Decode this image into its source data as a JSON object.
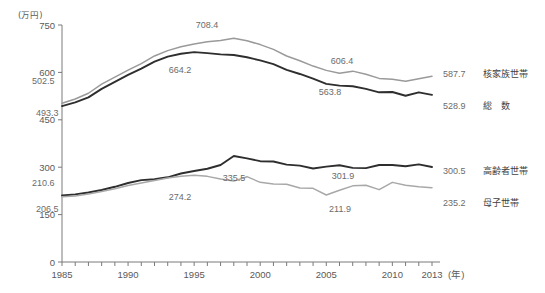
{
  "chart_data": {
    "type": "line",
    "title": "",
    "unit_label": "(万円)",
    "xlabel": "(年)",
    "ylabel": "",
    "xlim": [
      1985,
      2013
    ],
    "ylim": [
      0,
      750
    ],
    "yticks": [
      0,
      150,
      300,
      450,
      600,
      750
    ],
    "xticks_labeled": [
      "1985",
      "1990",
      "1995",
      "2000",
      "2005",
      "2010",
      "2013"
    ],
    "xticks_labeled_values": [
      1985,
      1990,
      1995,
      2000,
      2005,
      2010,
      2013
    ],
    "x": [
      1985,
      1986,
      1987,
      1988,
      1989,
      1990,
      1991,
      1992,
      1993,
      1994,
      1995,
      1996,
      1997,
      1998,
      1999,
      2000,
      2001,
      2002,
      2003,
      2004,
      2005,
      2006,
      2007,
      2008,
      2009,
      2010,
      2011,
      2012,
      2013
    ],
    "grid": false,
    "legend_position": "right-inline",
    "series": [
      {
        "name": "核家族世帯",
        "color": "#9a9a9a",
        "values": [
          502.5,
          516.0,
          534.0,
          563.0,
          585.0,
          607.0,
          628.0,
          652.0,
          669.0,
          681.0,
          690.0,
          697.0,
          701.0,
          708.4,
          700.0,
          688.0,
          673.0,
          652.0,
          637.0,
          620.0,
          606.4,
          597.0,
          604.0,
          594.0,
          581.0,
          578.0,
          572.0,
          580.0,
          587.7
        ]
      },
      {
        "name": "総　数",
        "color": "#2e2e2e",
        "values": [
          493.3,
          505.0,
          521.0,
          548.0,
          570.0,
          592.0,
          612.0,
          634.0,
          650.0,
          659.0,
          664.2,
          661.0,
          657.0,
          655.0,
          648.0,
          638.0,
          626.0,
          608.0,
          595.0,
          580.0,
          563.8,
          558.0,
          556.0,
          548.0,
          537.0,
          538.0,
          526.0,
          537.0,
          528.9
        ]
      },
      {
        "name": "高齢者世帯",
        "color": "#2e2e2e",
        "values": [
          210.6,
          214.0,
          220.0,
          228.0,
          238.0,
          250.0,
          259.0,
          262.0,
          268.0,
          280.0,
          288.0,
          295.0,
          307.0,
          335.5,
          328.0,
          319.0,
          318.0,
          308.0,
          305.0,
          296.0,
          301.9,
          306.0,
          298.0,
          297.0,
          307.0,
          307.0,
          303.0,
          309.0,
          300.5
        ]
      },
      {
        "name": "母子世帯",
        "color": "#a8a8a8",
        "values": [
          206.5,
          209.0,
          215.0,
          223.0,
          232.0,
          242.0,
          250.0,
          258.0,
          266.0,
          271.0,
          274.2,
          271.0,
          263.0,
          256.0,
          270.0,
          252.0,
          247.0,
          246.0,
          234.0,
          233.0,
          211.9,
          227.0,
          241.0,
          243.0,
          229.0,
          252.0,
          243.0,
          238.0,
          235.2
        ]
      }
    ],
    "inline_labels": [
      {
        "text": "502.5",
        "x": 32,
        "y": 84,
        "anchor": "start"
      },
      {
        "text": "493.3",
        "x": 36,
        "y": 116,
        "anchor": "start"
      },
      {
        "text": "708.4",
        "x": 207,
        "y": 28,
        "anchor": "middle"
      },
      {
        "text": "664.2",
        "x": 180,
        "y": 73,
        "anchor": "middle"
      },
      {
        "text": "606.4",
        "x": 342,
        "y": 64,
        "anchor": "middle"
      },
      {
        "text": "563.8",
        "x": 330,
        "y": 95,
        "anchor": "middle"
      },
      {
        "text": "210.6",
        "x": 32,
        "y": 186,
        "anchor": "start"
      },
      {
        "text": "206.5",
        "x": 36,
        "y": 212,
        "anchor": "start"
      },
      {
        "text": "335.5",
        "x": 234,
        "y": 181,
        "anchor": "middle"
      },
      {
        "text": "274.2",
        "x": 180,
        "y": 200,
        "anchor": "middle"
      },
      {
        "text": "301.9",
        "x": 343,
        "y": 179,
        "anchor": "middle"
      },
      {
        "text": "211.9",
        "x": 340,
        "y": 212,
        "anchor": "middle"
      }
    ],
    "end_labels": [
      {
        "value": "587.7",
        "name": "核家族世帯",
        "y": 73
      },
      {
        "value": "528.9",
        "name": "総　数",
        "y": 105
      },
      {
        "value": "300.5",
        "name": "高齢者世帯",
        "y": 170
      },
      {
        "value": "235.2",
        "name": "母子世帯",
        "y": 202
      }
    ]
  }
}
